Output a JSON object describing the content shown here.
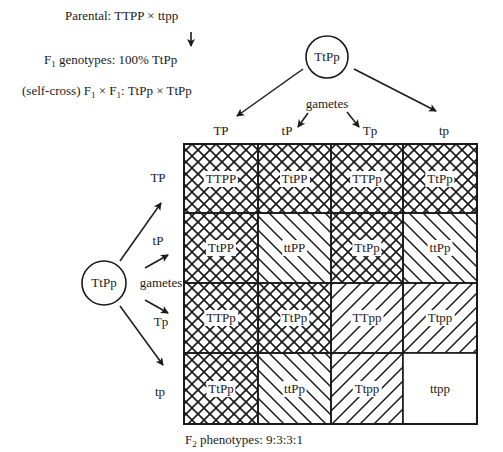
{
  "header": {
    "parental_prefix": "Parental: ",
    "parental_cross": "TTPP × ttpp",
    "f1_prefix": "F",
    "f1_sub": "1",
    "f1_text": " genotypes: 100% TtPp",
    "selfcross_prefix": "(self-cross) F",
    "selfcross_sub1": "1",
    "selfcross_mid": " × F",
    "selfcross_sub2": "1",
    "selfcross_text": ": TtPp × TtPp"
  },
  "top_parent": {
    "genotype": "TtPp",
    "gametes_label": "gametes",
    "gametes": [
      "TP",
      "tP",
      "Tp",
      "tp"
    ]
  },
  "left_parent": {
    "genotype": "TtPp",
    "gametes_label": "gametes",
    "gametes": [
      "TP",
      "tP",
      "Tp",
      "tp"
    ]
  },
  "punnett": {
    "rows": [
      [
        "TTPP",
        "TtPP",
        "TTPp",
        "TtPp"
      ],
      [
        "TtPP",
        "ttPP",
        "TtPp",
        "ttPp"
      ],
      [
        "TTPp",
        "TtPp",
        "TTpp",
        "Ttpp"
      ],
      [
        "TtPp",
        "ttPp",
        "Ttpp",
        "ttpp"
      ]
    ],
    "patterns": [
      [
        "crosshatch",
        "crosshatch",
        "crosshatch",
        "crosshatch"
      ],
      [
        "crosshatch",
        "backslash",
        "crosshatch",
        "backslash"
      ],
      [
        "crosshatch",
        "crosshatch",
        "slash",
        "slash"
      ],
      [
        "crosshatch",
        "backslash",
        "slash",
        "none"
      ]
    ]
  },
  "footer": {
    "prefix": "F",
    "sub": "2",
    "text": " phenotypes: 9:3:3:1"
  },
  "colors": {
    "ink": "#1a1a1a",
    "background": "#ffffff"
  }
}
